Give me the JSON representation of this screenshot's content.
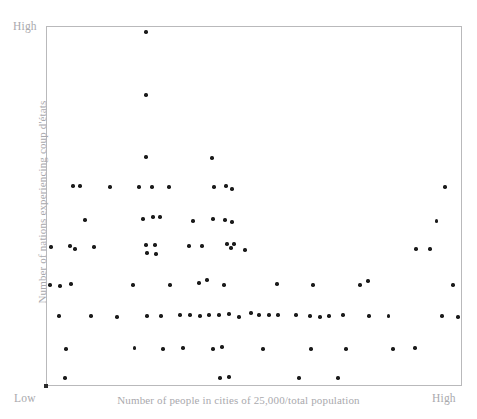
{
  "figure": {
    "background_color": "#ffffff",
    "frame_color": "#b9b9bb",
    "point_color": "#1b1b1b",
    "label_color": "#a9a9ad"
  },
  "axes": {
    "x_title": "Number of people in cities of 25,000/total population",
    "y_title": "Number of nations experiencing coup d'états",
    "x_low_label": "Low",
    "x_high_label": "High",
    "y_high_label": "High"
  },
  "chart_data": {
    "type": "scatter",
    "title": "",
    "xlabel": "Number of people in cities of 25,000/total population",
    "ylabel": "Number of nations experiencing coup d'états",
    "xlim": [
      0,
      100
    ],
    "ylim": [
      0,
      100
    ],
    "x_tick_labels": [
      "Low",
      "High"
    ],
    "y_tick_labels": [
      "",
      "High"
    ],
    "grid": false,
    "legend": null,
    "n_points": 92,
    "points": [
      [
        24.0,
        98.3
      ],
      [
        24.0,
        80.8
      ],
      [
        24.0,
        63.6
      ],
      [
        39.9,
        63.3
      ],
      [
        6.5,
        55.6
      ],
      [
        8.2,
        55.6
      ],
      [
        15.4,
        55.3
      ],
      [
        22.4,
        55.3
      ],
      [
        25.5,
        55.3
      ],
      [
        29.6,
        55.3
      ],
      [
        40.4,
        55.3
      ],
      [
        43.3,
        55.6
      ],
      [
        44.7,
        54.7
      ],
      [
        95.9,
        55.3
      ],
      [
        9.4,
        46.1
      ],
      [
        23.3,
        46.4
      ],
      [
        25.7,
        46.9
      ],
      [
        27.4,
        46.9
      ],
      [
        35.3,
        45.8
      ],
      [
        40.1,
        46.4
      ],
      [
        43.0,
        46.1
      ],
      [
        44.7,
        45.6
      ],
      [
        93.9,
        45.8
      ],
      [
        1.2,
        38.6
      ],
      [
        5.8,
        38.9
      ],
      [
        7.0,
        38.1
      ],
      [
        11.5,
        38.6
      ],
      [
        24.0,
        39.2
      ],
      [
        24.3,
        36.9
      ],
      [
        26.2,
        39.2
      ],
      [
        26.4,
        36.7
      ],
      [
        34.4,
        38.9
      ],
      [
        37.5,
        38.9
      ],
      [
        43.5,
        39.4
      ],
      [
        44.5,
        38.3
      ],
      [
        45.2,
        39.4
      ],
      [
        47.8,
        37.8
      ],
      [
        88.9,
        38.1
      ],
      [
        92.3,
        38.1
      ],
      [
        1.0,
        28.1
      ],
      [
        3.4,
        27.8
      ],
      [
        6.0,
        28.3
      ],
      [
        20.9,
        28.1
      ],
      [
        29.8,
        28.1
      ],
      [
        36.8,
        28.6
      ],
      [
        38.7,
        29.4
      ],
      [
        42.8,
        28.1
      ],
      [
        55.5,
        28.3
      ],
      [
        64.2,
        28.1
      ],
      [
        75.5,
        28.1
      ],
      [
        77.4,
        29.2
      ],
      [
        97.8,
        28.1
      ],
      [
        3.1,
        19.4
      ],
      [
        10.8,
        19.4
      ],
      [
        17.1,
        19.2
      ],
      [
        24.3,
        19.4
      ],
      [
        27.6,
        19.4
      ],
      [
        32.2,
        19.7
      ],
      [
        34.6,
        19.7
      ],
      [
        37.0,
        19.4
      ],
      [
        39.2,
        19.7
      ],
      [
        41.6,
        19.7
      ],
      [
        44.0,
        20.0
      ],
      [
        46.4,
        19.2
      ],
      [
        49.3,
        20.3
      ],
      [
        51.2,
        19.7
      ],
      [
        53.6,
        19.7
      ],
      [
        55.8,
        19.7
      ],
      [
        60.1,
        19.7
      ],
      [
        63.5,
        19.4
      ],
      [
        65.9,
        19.2
      ],
      [
        68.0,
        19.4
      ],
      [
        71.4,
        19.7
      ],
      [
        77.6,
        19.4
      ],
      [
        82.4,
        19.4
      ],
      [
        95.2,
        19.4
      ],
      [
        99.0,
        19.2
      ],
      [
        4.8,
        10.3
      ],
      [
        21.2,
        10.6
      ],
      [
        28.1,
        10.3
      ],
      [
        32.9,
        10.6
      ],
      [
        40.1,
        10.3
      ],
      [
        42.3,
        10.8
      ],
      [
        52.2,
        10.3
      ],
      [
        63.7,
        10.3
      ],
      [
        72.1,
        10.3
      ],
      [
        83.4,
        10.3
      ],
      [
        88.7,
        10.6
      ],
      [
        4.6,
        2.2
      ],
      [
        41.8,
        2.2
      ],
      [
        44.0,
        2.5
      ],
      [
        60.8,
        2.2
      ],
      [
        70.2,
        2.2
      ]
    ]
  }
}
